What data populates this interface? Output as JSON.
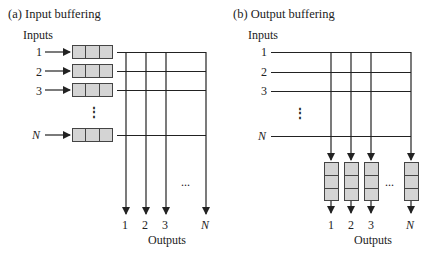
{
  "panel_a": {
    "title": "(a) Input buffering",
    "inputs_label": "Inputs",
    "input_labels": [
      "1",
      "2",
      "3",
      "N"
    ],
    "vdots": "⋮",
    "buffers": [
      {
        "cells": [
          "",
          "",
          "3"
        ]
      },
      {
        "cells": [
          "",
          "8",
          "3"
        ]
      },
      {
        "cells": [
          "",
          "",
          ""
        ]
      },
      {
        "cells": [
          "",
          "",
          ""
        ]
      }
    ],
    "output_labels": [
      "1",
      "2",
      "3",
      "N"
    ],
    "hdots": "...",
    "outputs_label": "Outputs"
  },
  "panel_b": {
    "title": "(b) Output buffering",
    "inputs_label": "Inputs",
    "input_labels": [
      "1",
      "2",
      "3",
      "N"
    ],
    "vdots": "⋮",
    "output_labels": [
      "1",
      "2",
      "3",
      "N"
    ],
    "hdots": "...",
    "outputs_label": "Outputs"
  },
  "colors": {
    "buffer_fill": "#d4d4d4",
    "line": "#222222"
  }
}
